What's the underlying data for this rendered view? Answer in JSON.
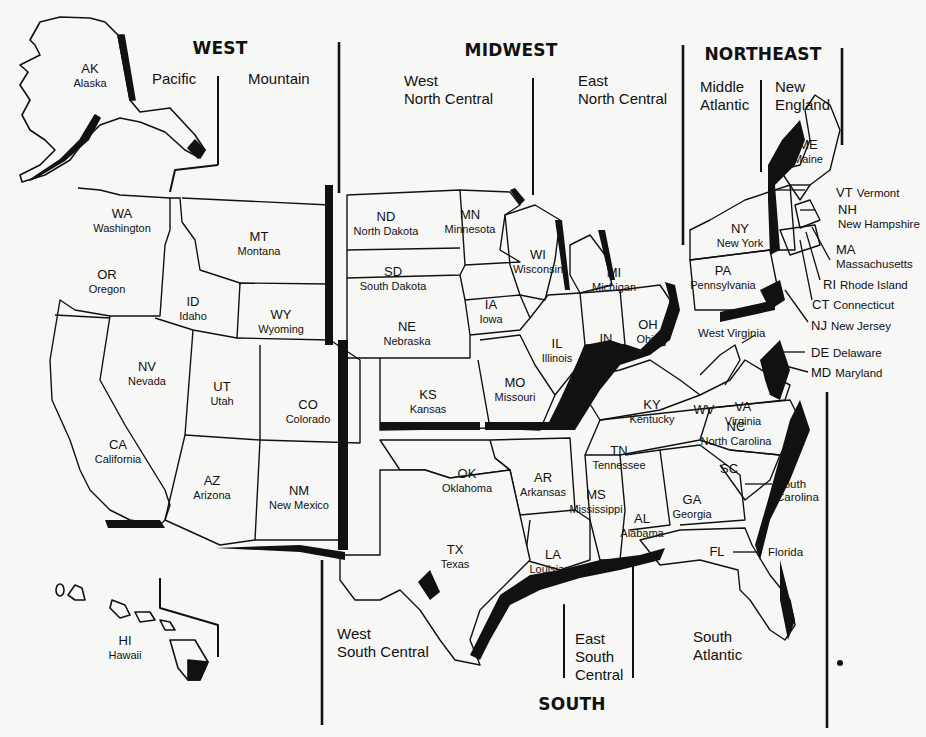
{
  "regions": {
    "west": "WEST",
    "midwest": "MIDWEST",
    "northeast": "NORTHEAST",
    "south": "SOUTH"
  },
  "divisions": {
    "pacific": "Pacific",
    "mountain": "Mountain",
    "west_north_central": "West\nNorth Central",
    "east_north_central": "East\nNorth Central",
    "middle_atlantic": "Middle\nAtlantic",
    "new_england": "New\nEngland",
    "west_south_central": "West\nSouth Central",
    "east_south_central": "East\nSouth\nCentral",
    "south_atlantic": "South\nAtlantic"
  },
  "states": {
    "AK": {
      "abbr": "AK",
      "name": "Alaska"
    },
    "HI": {
      "abbr": "HI",
      "name": "Hawaii"
    },
    "WA": {
      "abbr": "WA",
      "name": "Washington"
    },
    "OR": {
      "abbr": "OR",
      "name": "Oregon"
    },
    "CA": {
      "abbr": "CA",
      "name": "California"
    },
    "NV": {
      "abbr": "NV",
      "name": "Nevada"
    },
    "ID": {
      "abbr": "ID",
      "name": "Idaho"
    },
    "MT": {
      "abbr": "MT",
      "name": "Montana"
    },
    "WY": {
      "abbr": "WY",
      "name": "Wyoming"
    },
    "UT": {
      "abbr": "UT",
      "name": "Utah"
    },
    "CO": {
      "abbr": "CO",
      "name": "Colorado"
    },
    "AZ": {
      "abbr": "AZ",
      "name": "Arizona"
    },
    "NM": {
      "abbr": "NM",
      "name": "New Mexico"
    },
    "ND": {
      "abbr": "ND",
      "name": "North Dakota"
    },
    "SD": {
      "abbr": "SD",
      "name": "South Dakota"
    },
    "NE": {
      "abbr": "NE",
      "name": "Nebraska"
    },
    "KS": {
      "abbr": "KS",
      "name": "Kansas"
    },
    "MN": {
      "abbr": "MN",
      "name": "Minnesota"
    },
    "IA": {
      "abbr": "IA",
      "name": "Iowa"
    },
    "MO": {
      "abbr": "MO",
      "name": "Missouri"
    },
    "WI": {
      "abbr": "WI",
      "name": "Wisconsin"
    },
    "IL": {
      "abbr": "IL",
      "name": "Illinois"
    },
    "MI": {
      "abbr": "MI",
      "name": "Michigan"
    },
    "IN": {
      "abbr": "IN",
      "name": "Indiana"
    },
    "OH": {
      "abbr": "OH",
      "name": "Ohio"
    },
    "ME": {
      "abbr": "ME",
      "name": "Maine"
    },
    "VT": {
      "abbr": "VT",
      "name": "Vermont"
    },
    "NH": {
      "abbr": "NH",
      "name": "New Hampshire"
    },
    "MA": {
      "abbr": "MA",
      "name": "Massachusetts"
    },
    "RI": {
      "abbr": "RI",
      "name": "Rhode Island"
    },
    "CT": {
      "abbr": "CT",
      "name": "Connecticut"
    },
    "NY": {
      "abbr": "NY",
      "name": "New York"
    },
    "PA": {
      "abbr": "PA",
      "name": "Pennsylvania"
    },
    "NJ": {
      "abbr": "NJ",
      "name": "New Jersey"
    },
    "DE": {
      "abbr": "DE",
      "name": "Delaware"
    },
    "MD": {
      "abbr": "MD",
      "name": "Maryland"
    },
    "WV": {
      "abbr": "WV",
      "name": "West Virginia"
    },
    "VA": {
      "abbr": "VA",
      "name": "Virginia"
    },
    "NC": {
      "abbr": "NC",
      "name": "North Carolina"
    },
    "SC": {
      "abbr": "SC",
      "name": "South Carolina"
    },
    "GA": {
      "abbr": "GA",
      "name": "Georgia"
    },
    "FL": {
      "abbr": "FL",
      "name": "Florida"
    },
    "KY": {
      "abbr": "KY",
      "name": "Kentucky"
    },
    "TN": {
      "abbr": "TN",
      "name": "Tennessee"
    },
    "AL": {
      "abbr": "AL",
      "name": "Alabama"
    },
    "MS": {
      "abbr": "MS",
      "name": "Mississippi"
    },
    "AR": {
      "abbr": "AR",
      "name": "Arkansas"
    },
    "LA": {
      "abbr": "LA",
      "name": "Louisiana"
    },
    "OK": {
      "abbr": "OK",
      "name": "Oklahoma"
    },
    "TX": {
      "abbr": "TX",
      "name": "Texas"
    }
  },
  "colors": {
    "paper": "#f7f7f5",
    "ink": "#111111"
  }
}
